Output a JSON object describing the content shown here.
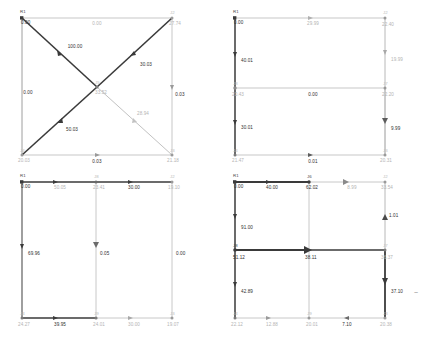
{
  "figure": {
    "type": "network-diagram-grid",
    "panel_count": 4
  },
  "colors": {
    "pipe_thin": "#a9a9a9",
    "pipe_thick": "#3a3a3a",
    "node_dark": "#444444",
    "node_light": "#b0b0b0",
    "text_dark": "#2f2f2f",
    "text_grey": "#b4b4b4",
    "background": "#ffffff"
  },
  "panels": [
    {
      "id": "panel-1",
      "name": "top-left-network",
      "nodes": [
        {
          "id": "R1",
          "label": "R1",
          "value": "0.00",
          "tone": "dark"
        },
        {
          "id": "J2",
          "label": "J2",
          "value": "27.74",
          "tone": "grey"
        },
        {
          "id": "J5",
          "label": "J5",
          "value": "33.52",
          "tone": "grey"
        },
        {
          "id": "J4",
          "label": "J4",
          "value": "20.03",
          "tone": "grey"
        },
        {
          "id": "J3",
          "label": "J3",
          "value": "21.18",
          "tone": "grey"
        }
      ],
      "links": [
        {
          "from": "R1",
          "to": "J2",
          "value": "0.00",
          "tone": "grey"
        },
        {
          "from": "R1",
          "to": "J5",
          "value": "100.00",
          "tone": "dark"
        },
        {
          "from": "J5",
          "to": "J2",
          "value": "30.03",
          "tone": "dark"
        },
        {
          "from": "J4",
          "to": "J5",
          "value": "50.03",
          "tone": "dark"
        },
        {
          "from": "J5",
          "to": "J3",
          "value": "28.94",
          "tone": "grey"
        },
        {
          "from": "R1",
          "to": "J4",
          "value": "0.00",
          "tone": "dark"
        },
        {
          "from": "J2",
          "to": "J3",
          "value": "0.03",
          "tone": "dark"
        },
        {
          "from": "J4",
          "to": "J3",
          "value": "0.03",
          "tone": "dark"
        }
      ]
    },
    {
      "id": "panel-2",
      "name": "top-right-network",
      "nodes": [
        {
          "id": "R1",
          "label": "R1",
          "value": "0.00",
          "tone": "dark"
        },
        {
          "id": "J2",
          "label": "J2",
          "value": "22.40",
          "tone": "grey"
        },
        {
          "id": "J8",
          "label": "J8",
          "value": "20.43",
          "tone": "grey"
        },
        {
          "id": "J7",
          "label": "J7",
          "value": "22.20",
          "tone": "grey"
        },
        {
          "id": "J4",
          "label": "J4",
          "value": "21.47",
          "tone": "grey"
        },
        {
          "id": "J3",
          "label": "J3",
          "value": "20.31",
          "tone": "grey"
        }
      ],
      "links": [
        {
          "from": "R1",
          "to": "J2",
          "value": "29.99",
          "tone": "grey"
        },
        {
          "from": "R1",
          "to": "J8",
          "value": "40.01",
          "tone": "dark"
        },
        {
          "from": "J2",
          "to": "J7",
          "value": "19.99",
          "tone": "grey"
        },
        {
          "from": "J8",
          "to": "J7",
          "value": "0.00",
          "tone": "dark"
        },
        {
          "from": "J8",
          "to": "J4",
          "value": "30.01",
          "tone": "dark"
        },
        {
          "from": "J7",
          "to": "J3",
          "value": "9.99",
          "tone": "dark"
        },
        {
          "from": "J4",
          "to": "J3",
          "value": "0.01",
          "tone": "dark"
        }
      ]
    },
    {
      "id": "panel-3",
      "name": "bottom-left-network",
      "nodes": [
        {
          "id": "R1",
          "label": "R1",
          "value": "0.00",
          "tone": "dark"
        },
        {
          "id": "J8",
          "label": "J8",
          "value": "23.41",
          "tone": "grey"
        },
        {
          "id": "J2",
          "label": "J2",
          "value": "19.10",
          "tone": "grey"
        },
        {
          "id": "J4",
          "label": "J4",
          "value": "24.27",
          "tone": "grey"
        },
        {
          "id": "J9",
          "label": "J9",
          "value": "24.01",
          "tone": "grey"
        },
        {
          "id": "J3",
          "label": "J3",
          "value": "19.07",
          "tone": "grey"
        }
      ],
      "links": [
        {
          "from": "R1",
          "to": "J8",
          "value": "50.05",
          "tone": "dark"
        },
        {
          "from": "J8",
          "to": "J2",
          "value": "30.00",
          "tone": "dark"
        },
        {
          "from": "R1",
          "to": "J4",
          "value": "69.96",
          "tone": "dark"
        },
        {
          "from": "J8",
          "to": "J9",
          "value": "0.05",
          "tone": "dark"
        },
        {
          "from": "J2",
          "to": "J3",
          "value": "0.00",
          "tone": "dark"
        },
        {
          "from": "J4",
          "to": "J9",
          "value": "39.95",
          "tone": "dark"
        },
        {
          "from": "J9",
          "to": "J3",
          "value": "30.00",
          "tone": "grey"
        }
      ]
    },
    {
      "id": "panel-4",
      "name": "bottom-right-network",
      "nodes": [
        {
          "id": "R1",
          "label": "R1",
          "value": "0.00",
          "tone": "dark"
        },
        {
          "id": "J6",
          "label": "J6",
          "value": "62.02",
          "tone": "dark"
        },
        {
          "id": "J2",
          "label": "J2",
          "value": "33.54",
          "tone": "grey"
        },
        {
          "id": "J8",
          "label": "J8",
          "value": "51.12",
          "tone": "dark"
        },
        {
          "id": "J7",
          "label": "J7",
          "value": "36.37",
          "tone": "grey"
        },
        {
          "id": "J4",
          "label": "J4",
          "value": "22.12",
          "tone": "grey"
        },
        {
          "id": "J9",
          "label": "J9",
          "value": "20.01",
          "tone": "grey"
        },
        {
          "id": "J3",
          "label": "J3",
          "value": "20.38",
          "tone": "grey"
        }
      ],
      "links": [
        {
          "from": "R1",
          "to": "J6",
          "value": "40.00",
          "tone": "dark"
        },
        {
          "from": "J6",
          "to": "J2",
          "value": "8.99",
          "tone": "grey"
        },
        {
          "from": "R1",
          "to": "J8",
          "value": "91.00",
          "tone": "dark"
        },
        {
          "from": "J2",
          "to": "J7",
          "value": "1.01",
          "tone": "dark"
        },
        {
          "from": "J8",
          "to": "J7",
          "value": "38.11",
          "tone": "dark"
        },
        {
          "from": "J6",
          "to": "J7b",
          "value": "01",
          "tone": "dark"
        },
        {
          "from": "J8",
          "to": "J4",
          "value": "42.89",
          "tone": "dark"
        },
        {
          "from": "J7",
          "to": "J3",
          "value": "37.10",
          "tone": "dark"
        },
        {
          "from": "J4",
          "to": "J9",
          "value": "12.88",
          "tone": "grey"
        },
        {
          "from": "J9",
          "to": "J3",
          "value": "7.10",
          "tone": "dark"
        }
      ],
      "annotation": "~"
    }
  ]
}
